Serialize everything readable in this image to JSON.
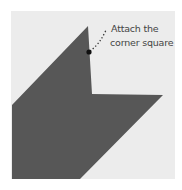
{
  "diagram": {
    "annotation": {
      "line1": "Attach the",
      "line2": "corner square"
    },
    "colors": {
      "background": "#ececec",
      "shape": "#575757",
      "marker": "#111111",
      "leader": "#333333"
    },
    "marker_dot": {
      "x": 89,
      "y": 52
    }
  }
}
